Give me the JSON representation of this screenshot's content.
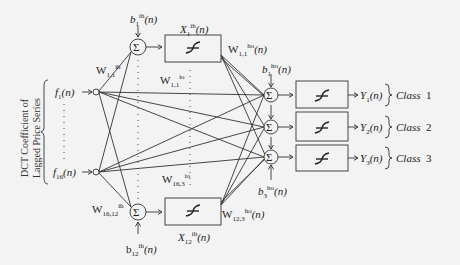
{
  "figure": {
    "input_axis_label_line1": "DCT Coefficient of",
    "input_axis_label_line2": "Lagged Price Series",
    "inputs": [
      {
        "name": "f",
        "sub": "1",
        "arg": "(n)"
      },
      {
        "name": "f",
        "sub": "16",
        "arg": "(n)"
      }
    ],
    "hidden_top": {
      "sum_symbol": "Σ",
      "activation_symbol": "f",
      "output_label": {
        "name": "X",
        "sub": "1",
        "sup": "ih",
        "arg": "(n)"
      },
      "bias_label": {
        "name": "b",
        "sub": "1",
        "sup": "ih",
        "arg": "(n)"
      },
      "input_weight": {
        "name": "W",
        "sub": "1,1",
        "sup": "ih"
      },
      "output_weight": {
        "name": "W",
        "sub": "1,1",
        "sup": "ho",
        "arg": "(n)"
      }
    },
    "hidden_bottom": {
      "sum_symbol": "Σ",
      "activation_symbol": "f",
      "output_label": {
        "name": "X",
        "sub": "12",
        "sup": "ih",
        "arg": "(n)"
      },
      "bias_label": {
        "name": "b",
        "sub": "12",
        "sup": "ih",
        "arg": "(n)"
      },
      "input_weight": {
        "name": "W",
        "sub": "16,12",
        "sup": "ih"
      },
      "output_weight": {
        "name": "W",
        "sub": "12,3",
        "sup": "ho",
        "arg": "(n)"
      }
    },
    "direct_weights": [
      {
        "name": "W",
        "sub": "1,1",
        "sup": "io"
      },
      {
        "name": "W",
        "sub": "16,3",
        "sup": "io"
      }
    ],
    "output_biases": [
      {
        "name": "b",
        "sub": "1",
        "sup": "ho",
        "arg": "(n)"
      },
      {
        "name": "b",
        "sub": "3",
        "sup": "ho",
        "arg": "(n)"
      }
    ],
    "outputs": [
      {
        "name": "Y",
        "sub": "1",
        "arg": "(n)",
        "class_label": "Class",
        "class_num": "1"
      },
      {
        "name": "Y",
        "sub": "2",
        "arg": "(n)",
        "class_label": "Class",
        "class_num": "2"
      },
      {
        "name": "Y",
        "sub": "3",
        "arg": "(n)",
        "class_label": "Class",
        "class_num": "3"
      }
    ]
  }
}
